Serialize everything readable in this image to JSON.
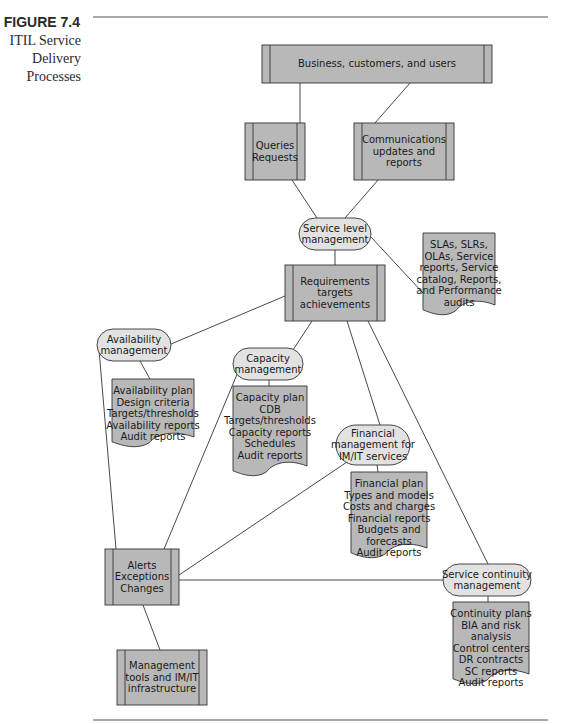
{
  "figure": {
    "number": "FIGURE 7.4",
    "caption_lines": [
      "ITIL Service",
      "Delivery",
      "Processes"
    ]
  },
  "colors": {
    "box_fill": "#b8b8b8",
    "oval_fill": "#e2e2e2",
    "stroke": "#333333",
    "rule": "#555555"
  },
  "nodes": {
    "business": {
      "type": "process",
      "x": 262,
      "y": 45,
      "w": 230,
      "h": 38,
      "lines": [
        "Business, customers, and users"
      ]
    },
    "queries": {
      "type": "process",
      "x": 245,
      "y": 123,
      "w": 60,
      "h": 57,
      "lines": [
        "Queries",
        "Requests"
      ]
    },
    "communications": {
      "type": "process",
      "x": 354,
      "y": 123,
      "w": 100,
      "h": 57,
      "lines": [
        "Communications",
        "updates and",
        "reports"
      ]
    },
    "slm": {
      "type": "oval",
      "x": 299,
      "y": 218,
      "w": 72,
      "h": 32,
      "lines": [
        "Service level",
        "management"
      ]
    },
    "requirements": {
      "type": "process",
      "x": 285,
      "y": 265,
      "w": 100,
      "h": 56,
      "lines": [
        "Requirements",
        "targets",
        "achievements"
      ]
    },
    "sla_docs": {
      "type": "doc",
      "x": 423,
      "y": 233,
      "w": 72,
      "h": 78,
      "lines": [
        "SLAs, SLRs,",
        "OLAs, Service",
        "reports, Service",
        "catalog, Reports,",
        "and Performance",
        "audits"
      ]
    },
    "availability": {
      "type": "oval",
      "x": 97,
      "y": 329,
      "w": 74,
      "h": 32,
      "lines": [
        "Availability",
        "management"
      ]
    },
    "availability_docs": {
      "type": "doc",
      "x": 112,
      "y": 379,
      "w": 82,
      "h": 64,
      "lines": [
        "Availability plan",
        "Design criteria",
        "Targets/thresholds",
        "Availability reports",
        "Audit reports"
      ]
    },
    "capacity": {
      "type": "oval",
      "x": 233,
      "y": 348,
      "w": 70,
      "h": 32,
      "lines": [
        "Capacity",
        "management"
      ]
    },
    "capacity_docs": {
      "type": "doc",
      "x": 233,
      "y": 386,
      "w": 74,
      "h": 86,
      "lines": [
        "Capacity plan",
        "CDB",
        "Targets/thresholds",
        "Capacity reports",
        "Schedules",
        "Audit reports"
      ]
    },
    "financial": {
      "type": "oval",
      "x": 336,
      "y": 425,
      "w": 74,
      "h": 40,
      "lines": [
        "Financial",
        "management for",
        "IM/IT services"
      ]
    },
    "financial_docs": {
      "type": "doc",
      "x": 351,
      "y": 472,
      "w": 76,
      "h": 82,
      "lines": [
        "Financial plan",
        "Types and models",
        "Costs and charges",
        "Financial reports",
        "Budgets and",
        "forecasts",
        "Audit reports"
      ]
    },
    "alerts": {
      "type": "process",
      "x": 105,
      "y": 549,
      "w": 74,
      "h": 56,
      "lines": [
        "Alerts",
        "Exceptions",
        "Changes"
      ]
    },
    "continuity": {
      "type": "oval",
      "x": 443,
      "y": 564,
      "w": 88,
      "h": 32,
      "lines": [
        "Service continuity",
        "management"
      ]
    },
    "continuity_docs": {
      "type": "doc",
      "x": 453,
      "y": 602,
      "w": 76,
      "h": 78,
      "lines": [
        "Continuity plans",
        "BIA and risk",
        "analysis",
        "Control centers",
        "DR contracts",
        "SC reports",
        "Audit reports"
      ]
    },
    "mgmt_tools": {
      "type": "process",
      "x": 117,
      "y": 650,
      "w": 90,
      "h": 55,
      "lines": [
        "Management",
        "tools and IM/IT",
        "infrastructure"
      ]
    }
  },
  "edges": [
    {
      "from": "business",
      "to": "queries",
      "x1": 300,
      "y1": 83,
      "x2": 300,
      "y2": 123
    },
    {
      "from": "business",
      "to": "communications",
      "x1": 410,
      "y1": 83,
      "x2": 375,
      "y2": 123
    },
    {
      "from": "queries",
      "to": "slm",
      "x1": 292,
      "y1": 180,
      "x2": 317,
      "y2": 218
    },
    {
      "from": "communications",
      "to": "slm",
      "x1": 378,
      "y1": 180,
      "x2": 345,
      "y2": 218
    },
    {
      "from": "slm",
      "to": "requirements",
      "x1": 335,
      "y1": 250,
      "x2": 335,
      "y2": 265
    },
    {
      "from": "slm",
      "to": "sla_docs",
      "x1": 371,
      "y1": 237,
      "x2": 423,
      "y2": 293
    },
    {
      "from": "requirements",
      "to": "availability",
      "x1": 285,
      "y1": 296,
      "x2": 171,
      "y2": 344
    },
    {
      "from": "requirements",
      "to": "capacity",
      "x1": 312,
      "y1": 321,
      "x2": 293,
      "y2": 350
    },
    {
      "from": "requirements",
      "to": "financial",
      "x1": 347,
      "y1": 321,
      "x2": 380,
      "y2": 425
    },
    {
      "from": "requirements",
      "to": "continuity",
      "x1": 368,
      "y1": 321,
      "x2": 488,
      "y2": 564
    },
    {
      "from": "availability",
      "to": "availability_docs",
      "x1": 140,
      "y1": 361,
      "x2": 150,
      "y2": 379
    },
    {
      "from": "capacity",
      "to": "capacity_docs",
      "x1": 269,
      "y1": 380,
      "x2": 269,
      "y2": 386
    },
    {
      "from": "financial",
      "to": "financial_docs",
      "x1": 377,
      "y1": 465,
      "x2": 378,
      "y2": 472
    },
    {
      "from": "continuity",
      "to": "continuity_docs",
      "x1": 488,
      "y1": 596,
      "x2": 488,
      "y2": 602
    },
    {
      "from": "availability",
      "to": "alerts",
      "x1": 99,
      "y1": 350,
      "x2": 116,
      "y2": 549
    },
    {
      "from": "capacity",
      "to": "alerts",
      "x1": 238,
      "y1": 372,
      "x2": 164,
      "y2": 549
    },
    {
      "from": "financial",
      "to": "alerts",
      "x1": 350,
      "y1": 460,
      "x2": 179,
      "y2": 575
    },
    {
      "from": "alerts",
      "to": "continuity",
      "x1": 179,
      "y1": 580,
      "x2": 443,
      "y2": 580
    },
    {
      "from": "alerts",
      "to": "mgmt_tools",
      "x1": 143,
      "y1": 605,
      "x2": 160,
      "y2": 650
    }
  ],
  "rules": [
    {
      "x1": 93,
      "y1": 17,
      "x2": 548,
      "y2": 17
    },
    {
      "x1": 93,
      "y1": 720,
      "x2": 548,
      "y2": 720
    }
  ]
}
